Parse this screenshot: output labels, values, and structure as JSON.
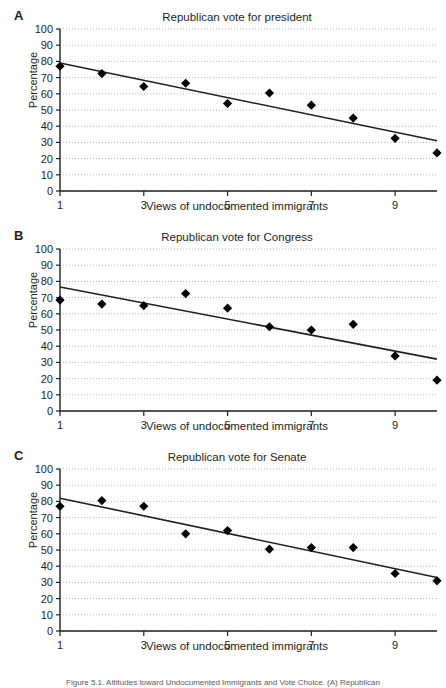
{
  "figure": {
    "caption": "Figure 5.1. Attitudes toward Undocumented Immigrants and Vote Choice. (A) Republican"
  },
  "chart_data": [
    {
      "type": "scatter",
      "panel": "A",
      "title": "Republican vote for president",
      "xlabel": "Views of undocumented immigrants",
      "ylabel": "Percentage",
      "xlim": [
        1,
        10
      ],
      "ylim": [
        0,
        100
      ],
      "yticks": [
        0,
        10,
        20,
        30,
        40,
        50,
        60,
        70,
        80,
        90,
        100
      ],
      "xticks": [
        1,
        3,
        5,
        7,
        9
      ],
      "grid": true,
      "legend": "none",
      "x": [
        1,
        2,
        3,
        4,
        5,
        6,
        7,
        8,
        9,
        10
      ],
      "values": [
        77,
        72.5,
        64.5,
        66.5,
        54,
        60.5,
        53,
        45,
        32.5,
        23.5
      ],
      "trendline": {
        "x": [
          1,
          10
        ],
        "y": [
          79,
          31
        ]
      },
      "marker": "diamond"
    },
    {
      "type": "scatter",
      "panel": "B",
      "title": "Republican vote for Congress",
      "xlabel": "Views of undocumented immigrants",
      "ylabel": "Percentage",
      "xlim": [
        1,
        10
      ],
      "ylim": [
        0,
        100
      ],
      "yticks": [
        0,
        10,
        20,
        30,
        40,
        50,
        60,
        70,
        80,
        90,
        100
      ],
      "xticks": [
        1,
        3,
        5,
        7,
        9
      ],
      "grid": true,
      "legend": "none",
      "x": [
        1,
        2,
        3,
        4,
        5,
        6,
        7,
        8,
        9,
        10
      ],
      "values": [
        68.5,
        66,
        65,
        72.5,
        63.5,
        52,
        50,
        53.5,
        34,
        19
      ],
      "trendline": {
        "x": [
          1,
          10
        ],
        "y": [
          76.5,
          32
        ]
      },
      "marker": "diamond"
    },
    {
      "type": "scatter",
      "panel": "C",
      "title": "Republican vote for Senate",
      "xlabel": "Views of undocumented immigrants",
      "ylabel": "Percentage",
      "xlim": [
        1,
        10
      ],
      "ylim": [
        0,
        100
      ],
      "yticks": [
        0,
        10,
        20,
        30,
        40,
        50,
        60,
        70,
        80,
        90,
        100
      ],
      "xticks": [
        1,
        3,
        5,
        7,
        9
      ],
      "grid": true,
      "legend": "none",
      "x": [
        1,
        2,
        3,
        4,
        5,
        6,
        7,
        8,
        9,
        10
      ],
      "values": [
        77,
        80.5,
        77,
        60,
        62,
        50.5,
        51.5,
        51.5,
        35.5,
        31
      ],
      "trendline": {
        "x": [
          1,
          10
        ],
        "y": [
          82,
          33
        ]
      },
      "marker": "diamond"
    }
  ],
  "panels": [
    {
      "letter": "A",
      "title": "Republican vote for president",
      "xlabel": "Views of undocumented immigrants",
      "ylabel": "Percentage"
    },
    {
      "letter": "B",
      "title": "Republican vote for Congress",
      "xlabel": "Views of undocumented immigrants",
      "ylabel": "Percentage"
    },
    {
      "letter": "C",
      "title": "Republican vote for Senate",
      "xlabel": "Views of undocumented immigrants",
      "ylabel": "Percentage"
    }
  ]
}
